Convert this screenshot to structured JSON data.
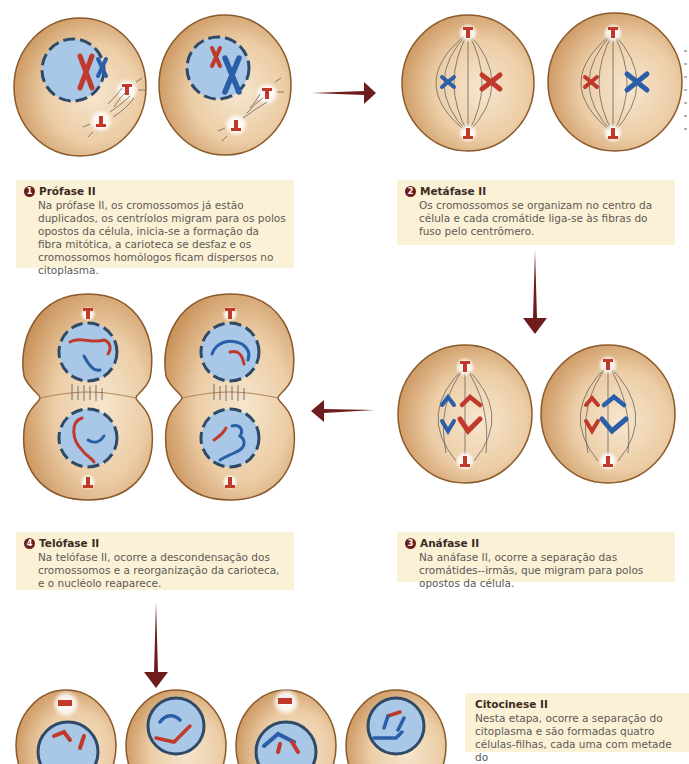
{
  "colors": {
    "arrow": "#6e1d1d",
    "caption_bg": "#fbf1d6",
    "cell_fill": "#e8c79f",
    "cell_border": "#8b5a2b",
    "nucleus": "#a9c7e6",
    "nucleus_border": "#2e4a66",
    "chromosome_red": "#c0392b",
    "chromosome_blue": "#2a5ea8",
    "number_badge": "#6e1d1d"
  },
  "stages": [
    {
      "number": "1",
      "title": "Prófase II",
      "text": "Na prófase II, os cromossomos já estão duplicados, os centríolos migram para os polos opostos da célula, inicia-se a formação da fibra mitótica, a carioteca se desfaz e os cromossomos homólogos ficam dispersos no citoplasma."
    },
    {
      "number": "2",
      "title": "Metáfase II",
      "text": "Os cromossomos se organizam no centro da célula e cada cromátide liga-se às fibras do fuso pelo centrômero."
    },
    {
      "number": "3",
      "title": "Anáfase II",
      "text": "Na anáfase II, ocorre a separação das cromátides--irmãs, que migram para polos opostos da célula."
    },
    {
      "number": "4",
      "title": "Telófase II",
      "text": "Na telófase II, ocorre a descondensação dos cromossomos e a reorganização da carioteca, e o nucléolo reaparece."
    },
    {
      "number": "",
      "title": "Citocinese II",
      "text": "Nesta etapa, ocorre a separação do citoplasma e são formadas quatro células-filhas, cada uma com metade do"
    }
  ],
  "arrows": [
    {
      "from": "prophase",
      "to": "metaphase",
      "direction": "right"
    },
    {
      "from": "metaphase",
      "to": "anaphase",
      "direction": "down"
    },
    {
      "from": "anaphase",
      "to": "telophase",
      "direction": "left"
    },
    {
      "from": "telophase",
      "to": "cytokinesis",
      "direction": "down"
    }
  ]
}
